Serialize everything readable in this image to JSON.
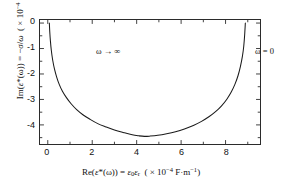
{
  "figure": {
    "background_color": "#ffffff",
    "frame_color": "#2b2b2b",
    "curve_color": "#1a1a1a"
  },
  "axes": {
    "x": {
      "label_html": "Re(<i>&#949;</i>*(&#969;)) = <i>&#949;</i><sub>0</sub><i>&#949;</i><sub>r</sub> &nbsp;( &#215; 10<sup>&#8722;4</sup> F&#183;m<sup>&#8722;1</sup>)",
      "label_text": "Re(ε*(ω)) = ε0εr  ( × 10−4 F·m−1)",
      "ticks": [
        "0",
        "2",
        "4",
        "6",
        "8"
      ],
      "tick_values": [
        0,
        2,
        4,
        6,
        8
      ],
      "range": [
        -0.35,
        9.55
      ]
    },
    "y": {
      "label_html": "Im(<i>&#949;</i>*(&#969;)) = &#8722;<i>&#963;</i>/<i>&#969;</i> &nbsp;( &#215; 10<sup>&#8722;4</sup> S&#183;m<sup>&#8722;1</sup>&#183;s)",
      "label_text": "Im(ε*(ω)) = −σ/ω  ( × 10−4 S·m−1·s)",
      "ticks": [
        "0",
        "-1",
        "-2",
        "-3",
        "-4"
      ],
      "tick_values": [
        0,
        -1,
        -2,
        -3,
        -4
      ],
      "range": [
        -4.75,
        0.12
      ]
    }
  },
  "annotations": [
    {
      "name": "omega-infinity",
      "text": "ω → ∞",
      "x": 0.55,
      "y": -0.28
    },
    {
      "name": "omega-zero",
      "text": "ω = 0",
      "x": 8.15,
      "y": -0.28
    }
  ],
  "chart_data": {
    "type": "line",
    "title": "",
    "xlabel": "Re(ε*(ω)) = ε0εr  ( × 10−4 F·m−1)",
    "ylabel": "Im(ε*(ω)) = −σ/ω  ( × 10−4 S·m−1·s)",
    "xlim": [
      -0.35,
      9.55
    ],
    "ylim": [
      -4.75,
      0.12
    ],
    "xticks": [
      0,
      2,
      4,
      6,
      8
    ],
    "yticks": [
      0,
      -1,
      -2,
      -3,
      -4
    ],
    "grid": false,
    "legend": "none",
    "series": [
      {
        "name": "Cole-Cole arc",
        "description": "Depressed-semicircle complex permittivity locus; begins at the high-frequency limit near the origin, descends steeply, reaches a minimum of about -4.45 near Re = 4.35, and returns to zero at Re = 8.9 in the zero-frequency limit.",
        "x": [
          0.07,
          0.09,
          0.12,
          0.16,
          0.22,
          0.3,
          0.4,
          0.52,
          0.66,
          0.84,
          1.05,
          1.3,
          1.58,
          1.9,
          2.25,
          2.62,
          3.0,
          3.4,
          3.8,
          4.1,
          4.35,
          4.6,
          4.95,
          5.35,
          5.75,
          6.15,
          6.55,
          6.92,
          7.25,
          7.55,
          7.82,
          8.05,
          8.25,
          8.42,
          8.56,
          8.67,
          8.76,
          8.82,
          8.86,
          8.89
        ],
        "y": [
          0.0,
          -0.35,
          -0.72,
          -1.08,
          -1.45,
          -1.8,
          -2.12,
          -2.42,
          -2.68,
          -2.93,
          -3.17,
          -3.4,
          -3.6,
          -3.78,
          -3.95,
          -4.08,
          -4.2,
          -4.3,
          -4.39,
          -4.43,
          -4.45,
          -4.44,
          -4.41,
          -4.35,
          -4.27,
          -4.16,
          -4.02,
          -3.86,
          -3.68,
          -3.48,
          -3.25,
          -3.0,
          -2.72,
          -2.41,
          -2.07,
          -1.7,
          -1.3,
          -0.9,
          -0.46,
          0.0
        ]
      }
    ]
  }
}
